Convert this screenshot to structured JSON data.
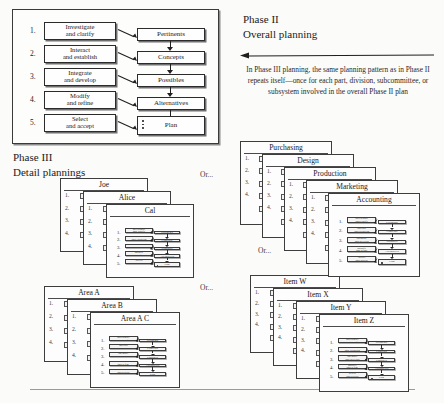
{
  "figure": {
    "phase2": {
      "heading_line1": "Phase II",
      "heading_line2": "Overall planning",
      "body": "In Phase III planning, the same planning pattern as in Phase II repeats itself—once for each part, division, subcommittee, or subsystem involved in the overall Phase II plan",
      "arrow_icon": "left-arrow-icon"
    },
    "phase3": {
      "heading_line1": "Phase III",
      "heading_line2": "Detail plannings"
    },
    "main_diagram": {
      "steps": [
        {
          "number": "1.",
          "line1": "Investigate",
          "line2": "and clarify"
        },
        {
          "number": "2.",
          "line1": "Interact",
          "line2": "and establish"
        },
        {
          "number": "3.",
          "line1": "Integrate",
          "line2": "and develop"
        },
        {
          "number": "4.",
          "line1": "Modify",
          "line2": "and refine"
        },
        {
          "number": "5.",
          "line1": "Select",
          "line2": "and accept"
        }
      ],
      "outputs": [
        "Pertinents",
        "Concepts",
        "Possibles",
        "Alternatives"
      ],
      "final_output": "Plan"
    },
    "or_labels": {
      "top": "Or...",
      "middle": "Or...",
      "bottom": "Or..."
    },
    "stacks": [
      {
        "id": "people",
        "cards": [
          "Joe",
          "Alice",
          "Cal"
        ]
      },
      {
        "id": "departments",
        "cards": [
          "Purchasing",
          "Design",
          "Production",
          "Marketing",
          "Accounting"
        ]
      },
      {
        "id": "areas",
        "cards": [
          "Area A",
          "Area B",
          "Area A C"
        ]
      },
      {
        "id": "items",
        "cards": [
          "Item W",
          "Item X",
          "Item Y",
          "Item Z"
        ]
      }
    ],
    "ghost_card_numbers": [
      "1.",
      "2.",
      "3.",
      "4."
    ],
    "colors": {
      "page_background": "#fbfbf9",
      "ink": "#1b1b1b",
      "box_fill": "#fefefe",
      "box_border": "#2b2b2b",
      "shadow": "#6f6f6f",
      "rule": "#9a9a9a"
    }
  }
}
